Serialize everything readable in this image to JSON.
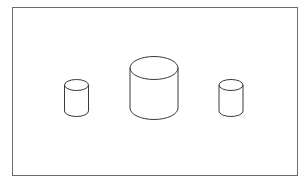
{
  "diagram": {
    "frame": {
      "x": 12,
      "y": 7,
      "width": 285,
      "height": 168,
      "stroke": "#6b6b6b"
    },
    "stroke_color": "#3a3a3a",
    "cylinders": [
      {
        "name": "small-left",
        "cx": 76.5,
        "top": 85,
        "bottom": 111,
        "rx": 12,
        "ry": 5.5
      },
      {
        "name": "large-center",
        "cx": 154,
        "top": 68,
        "bottom": 108,
        "rx": 24,
        "ry": 11.5
      },
      {
        "name": "small-right",
        "cx": 231,
        "top": 85,
        "bottom": 111,
        "rx": 12,
        "ry": 5.5
      }
    ]
  }
}
